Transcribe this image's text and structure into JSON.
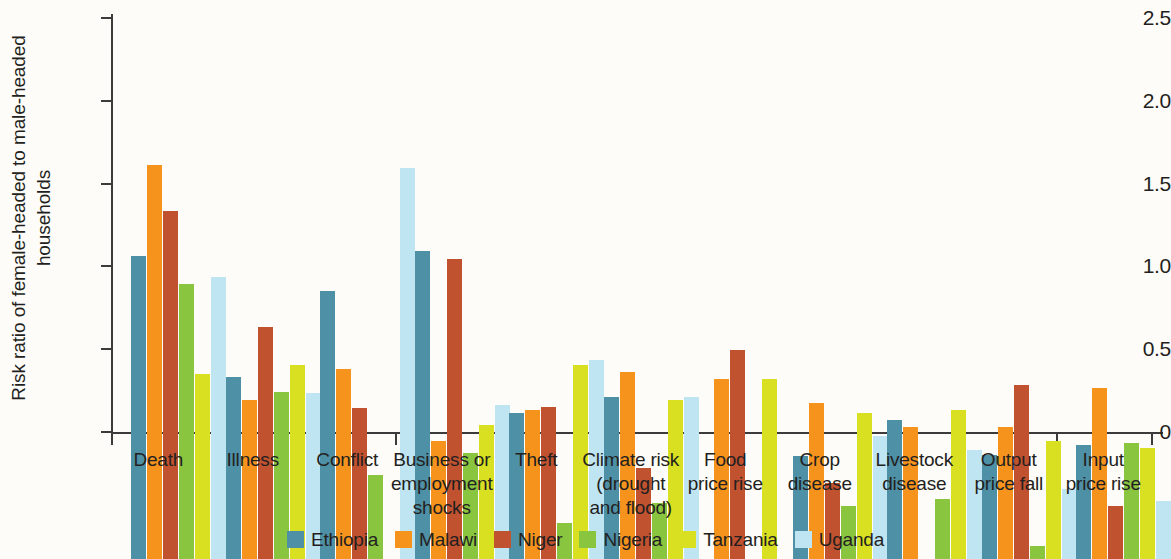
{
  "chart_data": {
    "type": "bar",
    "title": "",
    "subtitle": "",
    "xlabel": "",
    "ylabel": "Risk ratio of female-headed to male-headed households",
    "ylabel_lines": [
      "Risk ratio of female-headed to male-headed",
      "households"
    ],
    "ylim": [
      0,
      2.5
    ],
    "yticks": [
      0,
      0.5,
      1.0,
      1.5,
      2.0,
      2.5
    ],
    "ytick_labels": [
      "0",
      "0.5",
      "1.0",
      "1.5",
      "2.0",
      "2.5"
    ],
    "grid": false,
    "legend_position": "bottom",
    "categories": [
      "Death",
      "Illness",
      "Conflict",
      "Business or employment shocks",
      "Theft",
      "Climate risk (drought and flood)",
      "Food price rise",
      "Crop disease",
      "Livestock disease",
      "Output price fall",
      "Input price rise"
    ],
    "category_label_lines": [
      [
        "Death"
      ],
      [
        "Illness"
      ],
      [
        "Conflict"
      ],
      [
        "Business or",
        "employment",
        "shocks"
      ],
      [
        "Theft"
      ],
      [
        "Climate risk",
        "(drought",
        "and flood)"
      ],
      [
        "Food",
        "price rise"
      ],
      [
        "Crop",
        "disease"
      ],
      [
        "Livestock",
        "disease"
      ],
      [
        "Output",
        "price fall"
      ],
      [
        "Input",
        "price rise"
      ]
    ],
    "series": [
      {
        "name": "Ethiopia",
        "color": "#4e90a6",
        "values": [
          1.83,
          1.1,
          1.62,
          1.86,
          0.88,
          0.98,
          null,
          0.62,
          0.84,
          0.63,
          0.69
        ]
      },
      {
        "name": "Malawi",
        "color": "#f6931d",
        "values": [
          2.38,
          0.96,
          1.15,
          0.71,
          0.9,
          1.13,
          1.09,
          0.94,
          0.8,
          0.8,
          1.03
        ]
      },
      {
        "name": "Niger",
        "color": "#c0522f",
        "values": [
          2.1,
          1.4,
          0.91,
          1.81,
          0.92,
          0.55,
          1.26,
          0.46,
          null,
          1.05,
          0.32
        ]
      },
      {
        "name": "Nigeria",
        "color": "#8ac540",
        "values": [
          1.66,
          1.01,
          0.51,
          0.64,
          0.22,
          0.34,
          null,
          0.32,
          0.36,
          0.08,
          0.7
        ]
      },
      {
        "name": "Tanzania",
        "color": "#d9e021",
        "values": [
          1.12,
          1.17,
          null,
          0.81,
          1.17,
          0.96,
          1.09,
          0.88,
          0.9,
          0.71,
          0.67
        ]
      },
      {
        "name": "Uganda",
        "color": "#bfe5f3",
        "values": [
          1.7,
          1.0,
          2.36,
          0.93,
          1.2,
          0.98,
          null,
          0.74,
          0.66,
          0.42,
          0.35
        ]
      }
    ]
  },
  "legend": {
    "items": [
      {
        "label": "Ethiopia",
        "color": "#4e90a6"
      },
      {
        "label": "Malawi",
        "color": "#f6931d"
      },
      {
        "label": "Niger",
        "color": "#c0522f"
      },
      {
        "label": "Nigeria",
        "color": "#8ac540"
      },
      {
        "label": "Tanzania",
        "color": "#d9e021"
      },
      {
        "label": "Uganda",
        "color": "#bfe5f3"
      }
    ]
  }
}
